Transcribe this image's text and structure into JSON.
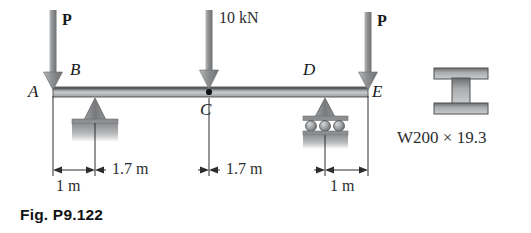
{
  "figure": {
    "caption": "Fig. P9.122",
    "section_label": "W200 × 19.3"
  },
  "loads": [
    {
      "name": "load-p-left",
      "label": "P",
      "x": 53,
      "tip_y": 88,
      "label_x": 62,
      "label_y": 16
    },
    {
      "name": "load-center",
      "label": "10 kN",
      "x": 209,
      "tip_y": 88,
      "label_x": 219,
      "label_y": 14
    },
    {
      "name": "load-p-right",
      "label": "P",
      "x": 368,
      "tip_y": 88,
      "label_x": 377,
      "label_y": 16
    }
  ],
  "points": [
    {
      "name": "point-a",
      "label": "A",
      "x": 28,
      "y": 86,
      "position": "left-of-beam-end"
    },
    {
      "name": "point-b",
      "label": "B",
      "x": 70,
      "y": 64,
      "position": "above-pin-support"
    },
    {
      "name": "point-c",
      "label": "C",
      "x": 200,
      "y": 102,
      "position": "below-center-load"
    },
    {
      "name": "point-d",
      "label": "D",
      "x": 303,
      "y": 64,
      "position": "above-roller-support"
    },
    {
      "name": "point-e",
      "label": "E",
      "x": 372,
      "y": 86,
      "position": "right-of-beam-end"
    }
  ],
  "dimensions": [
    {
      "name": "dim-1m-left",
      "label": "1 m",
      "from_x": 53,
      "to_x": 95,
      "label_x": 62,
      "label_y": 180
    },
    {
      "name": "dim-1p7-left",
      "label": "1.7 m",
      "from_x": 95,
      "to_x": 209,
      "label_x": 122,
      "label_y": 161
    },
    {
      "name": "dim-1p7-right",
      "label": "1.7 m",
      "from_x": 209,
      "to_x": 325,
      "label_x": 236,
      "label_y": 161
    },
    {
      "name": "dim-1m-right",
      "label": "1 m",
      "from_x": 325,
      "to_x": 368,
      "label_x": 332,
      "label_y": 180
    }
  ],
  "beam": {
    "name": "beam",
    "left_x": 53,
    "right_x": 368,
    "top_y": 87,
    "bottom_y": 97
  },
  "supports": {
    "pin": {
      "name": "pin-support",
      "x": 95,
      "label_hint": "triangle-on-hatched-base"
    },
    "roller": {
      "name": "roller-support",
      "x": 325,
      "label_hint": "triangle-on-three-rollers"
    }
  },
  "colors": {
    "ink": "#16181a",
    "beam_dark": "#6d6f71",
    "beam_light": "#c9cbcd",
    "arrow": "#8e9093",
    "support_fill": "#8b8d8f",
    "ground_fill": "#9b9d9f"
  }
}
